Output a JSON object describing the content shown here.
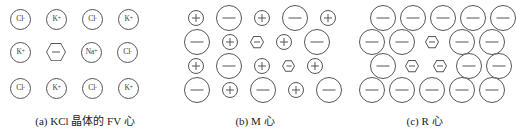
{
  "figure": {
    "background": "#ffffff",
    "stroke_color": "#55555a",
    "text_color": "#2b2b2b"
  },
  "panels": [
    {
      "id": "panel-a",
      "caption_prefix": "(a)",
      "caption_text": "KCl 晶体的 FV 心",
      "caption_full": "(a) KCl 晶体的 FV 心",
      "lattice_type": "labelled-ions",
      "rows": [
        [
          {
            "kind": "ion",
            "label": "Cl",
            "charge": "-"
          },
          {
            "kind": "ion",
            "label": "K",
            "charge": "+"
          },
          {
            "kind": "ion",
            "label": "Cl",
            "charge": "-"
          },
          {
            "kind": "ion",
            "label": "K",
            "charge": "+"
          }
        ],
        [
          {
            "kind": "ion",
            "label": "K",
            "charge": "+"
          },
          {
            "kind": "vacancy",
            "label": "",
            "charge": "-"
          },
          {
            "kind": "ion",
            "label": "Na",
            "charge": "+"
          },
          {
            "kind": "ion",
            "label": "Cl",
            "charge": "-"
          }
        ],
        [
          {
            "kind": "ion",
            "label": "Cl",
            "charge": "-"
          },
          {
            "kind": "ion",
            "label": "K",
            "charge": "+"
          },
          {
            "kind": "ion",
            "label": "Cl",
            "charge": "-"
          },
          {
            "kind": "ion",
            "label": "K",
            "charge": "+"
          }
        ]
      ]
    },
    {
      "id": "panel-b",
      "caption_prefix": "(b)",
      "caption_text": "M 心",
      "caption_full": "(b) M 心",
      "lattice_type": "charge-symbols",
      "rows": [
        [
          {
            "kind": "cation",
            "charge": "+"
          },
          {
            "kind": "anion",
            "charge": "-"
          },
          {
            "kind": "cation",
            "charge": "+"
          },
          {
            "kind": "anion",
            "charge": "-"
          },
          {
            "kind": "cation",
            "charge": "+"
          }
        ],
        [
          {
            "kind": "anion",
            "charge": "-"
          },
          {
            "kind": "cation",
            "charge": "+"
          },
          {
            "kind": "vacancy",
            "charge": "-"
          },
          {
            "kind": "cation",
            "charge": "+"
          },
          {
            "kind": "anion",
            "charge": "-"
          }
        ],
        [
          {
            "kind": "cation",
            "charge": "+"
          },
          {
            "kind": "anion",
            "charge": "-"
          },
          {
            "kind": "cation",
            "charge": "+"
          },
          {
            "kind": "vacancy",
            "charge": "-"
          },
          {
            "kind": "cation",
            "charge": "+"
          }
        ],
        [
          {
            "kind": "anion",
            "charge": "-"
          },
          {
            "kind": "cation",
            "charge": "+"
          },
          {
            "kind": "anion",
            "charge": "-"
          },
          {
            "kind": "cation",
            "charge": "+"
          },
          {
            "kind": "anion",
            "charge": "-"
          }
        ]
      ]
    },
    {
      "id": "panel-c",
      "caption_prefix": "(c)",
      "caption_text": "R 心",
      "caption_full": "(c) R 心",
      "lattice_type": "charge-symbols",
      "rows": [
        [
          {
            "kind": "anion",
            "charge": "-"
          },
          {
            "kind": "anion",
            "charge": "-"
          },
          {
            "kind": "anion",
            "charge": "-"
          },
          {
            "kind": "anion",
            "charge": "-"
          },
          {
            "kind": "anion",
            "charge": "-"
          }
        ],
        [
          {
            "kind": "anion",
            "charge": "-"
          },
          {
            "kind": "anion",
            "charge": "-"
          },
          {
            "kind": "vacancy",
            "charge": "-"
          },
          {
            "kind": "anion",
            "charge": "-"
          },
          {
            "kind": "anion",
            "charge": "-"
          }
        ],
        [
          {
            "kind": "anion",
            "charge": "-"
          },
          {
            "kind": "vacancy",
            "charge": "-"
          },
          {
            "kind": "vacancy",
            "charge": "-"
          },
          {
            "kind": "anion",
            "charge": "-"
          },
          {
            "kind": "anion",
            "charge": "-"
          }
        ],
        [
          {
            "kind": "anion",
            "charge": "-"
          },
          {
            "kind": "anion",
            "charge": "-"
          },
          {
            "kind": "anion",
            "charge": "-"
          },
          {
            "kind": "anion",
            "charge": "-"
          },
          {
            "kind": "anion",
            "charge": "-"
          }
        ]
      ]
    }
  ]
}
